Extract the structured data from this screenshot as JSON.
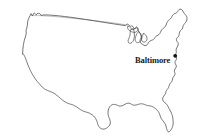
{
  "figure": {
    "type": "map",
    "region": "United States (contiguous 48 states)",
    "background_color": "#ffffff",
    "outline_color": "#3a3a3a",
    "width": 210,
    "height": 140
  },
  "markers": [
    {
      "name": "Baltimore",
      "label": "Baltimore",
      "dot_color": "#111111",
      "dot_x": 175.2,
      "dot_y": 55.8,
      "label_x": 135,
      "label_y": 55.5
    }
  ],
  "map_outline": {
    "mainland": "M22.6,53.9 L22.9,49.0 L23.4,44.6 L24.3,40.5 L25.4,36.8 L26.3,33.1 L26.0,30.6 L26.8,28.0 L27.4,25.1 L27.6,22.3 L28.2,19.6 L29.3,17.2 L30.3,15.2 L31.0,13.6 L31.6,14.7 L32.1,16.0 L32.9,15.1 L33.5,13.8 L34.2,12.9 L35.3,13.7 L36.2,14.9 L37.0,13.9 L38.1,13.2 L39.4,13.5 L40.4,14.2 L41.1,15.4 L42.6,15.1 L45.0,14.9 L48.5,15.0 L53.0,15.3 L58.5,15.8 L64.5,16.5 L71.0,17.3 L78.0,18.3 L85.5,19.4 L93.0,20.6 L100.5,21.8 L108.0,23.0 L114.5,24.0 L119.8,24.8 L123.0,25.3 L125.2,25.6 L126.4,24.9 L127.2,23.9 L128.3,24.6 L129.4,25.6 L130.6,26.3 L131.8,25.8 L132.9,26.6 L133.8,27.8 L134.6,29.0 L135.6,28.6 L136.4,27.7 L137.4,28.3 L138.0,29.6 L138.5,31.0 L139.3,32.2 L140.0,33.5 L140.7,34.9 L141.2,36.4 L141.0,38.0 L140.4,39.3 L140.0,40.7 L140.3,42.1 L141.0,43.2 L141.9,44.0 L142.9,44.6 L143.9,45.2 L145.0,45.6 L146.2,45.5 L147.1,44.8 L147.8,43.8 L148.4,42.6 L149.2,41.6 L150.2,40.9 L151.3,40.4 L152.4,40.0 L153.5,39.4 L154.4,38.5 L155.1,37.4 L155.9,36.4 L156.9,35.7 L158.0,35.2 L159.0,34.5 L159.8,33.5 L160.4,32.3 L161.0,31.0 L161.7,29.8 L162.6,28.8 L163.6,28.1 L164.6,27.3 L165.4,26.3 L166.0,25.1 L166.5,23.8 L167.0,22.5 L167.7,21.3 L168.6,20.3 L169.6,19.5 L170.6,18.6 L171.4,17.6 L172.0,16.4 L172.7,15.2 L173.6,14.3 L174.7,13.7 L175.8,13.2 L176.8,12.5 L177.6,11.6 L178.2,10.5 L179.0,9.6 L180.1,9.1 L181.2,9.3 L182.1,10.0 L182.8,11.0 L183.4,12.1 L184.1,13.2 L184.9,14.2 L185.8,15.1 L186.5,16.2 L186.9,17.5 L187.0,18.8 L186.8,20.1 L186.3,21.3 L185.6,22.4 L184.8,23.4 L184.0,24.4 L183.3,25.5 L182.9,26.8 L182.6,28.1 L182.0,29.2 L181.2,30.1 L180.3,30.9 L179.6,31.9 L179.3,33.1 L179.2,34.4 L178.9,35.6 L178.3,36.6 L177.5,37.4 L176.8,38.3 L176.4,39.5 L176.6,40.7 L177.2,41.7 L177.9,42.6 L178.3,43.7 L178.2,44.9 L177.8,46.0 L177.2,47.0 L176.6,48.0 L176.2,49.2 L176.1,50.4 L176.3,51.6 L176.2,52.8 L175.8,53.9 L175.2,54.9 L175.6,56.0 L176.2,57.0 L176.5,58.2 L176.3,59.4 L175.8,60.4 L175.2,61.4 L175.0,62.6 L175.3,63.8 L175.9,64.8 L176.3,65.9 L176.2,67.1 L175.7,68.1 L175.0,69.0 L174.5,70.1 L174.4,71.3 L174.7,72.5 L175.0,73.7 L174.8,74.9 L174.2,75.9 L173.5,76.8 L172.9,77.8 L172.5,79.0 L172.3,80.2 L171.9,81.3 L171.2,82.3 L170.4,83.2 L169.7,84.2 L169.2,85.3 L168.9,86.5 L168.5,87.6 L167.9,88.6 L167.2,89.5 L166.5,90.5 L166.0,91.6 L165.7,92.8 L165.3,93.9 L164.7,94.9 L164.0,95.8 L163.3,96.8 L162.8,97.9 L162.6,99.1 L162.8,100.3 L163.4,101.3 L164.2,102.1 L165.1,102.8 L166.0,103.6 L166.8,104.5 L167.5,105.5 L168.1,106.6 L168.6,107.7 L169.2,108.8 L169.8,109.9 L170.4,111.0 L171.0,112.1 L171.5,113.3 L171.9,114.5 L172.3,115.7 L172.6,116.9 L172.8,118.1 L173.0,119.3 L173.1,120.5 L173.2,121.7 L173.2,122.9 L173.1,124.1 L172.9,125.3 L172.6,126.5 L172.2,127.6 L171.7,128.7 L171.1,129.7 L170.4,130.6 L169.6,131.4 L168.8,132.0 L167.9,131.6 L167.3,130.7 L166.9,129.6 L166.6,128.4 L166.3,127.2 L166.0,126.0 L165.6,124.9 L165.1,123.8 L164.5,122.8 L163.8,121.9 L163.1,121.0 L162.4,120.1 L161.7,119.2 L161.1,118.2 L160.6,117.1 L160.2,116.0 L159.8,114.8 L159.4,113.7 L158.9,112.6 L158.3,111.6 L157.6,110.7 L156.9,109.9 L156.1,109.1 L155.3,108.4 L154.4,107.8 L153.5,107.2 L152.6,106.7 L151.6,106.3 L150.6,106.0 L149.6,105.8 L148.5,105.7 L147.5,105.5 L146.5,105.2 L145.5,104.8 L144.5,104.4 L143.5,104.1 L142.5,103.9 L141.5,103.8 L140.5,103.8 L139.5,104.0 L138.5,104.3 L137.5,104.6 L136.5,104.9 L135.5,105.1 L134.5,105.2 L133.5,105.1 L132.5,104.8 L131.6,104.3 L130.7,103.8 L129.8,103.4 L128.8,103.2 L127.8,103.2 L126.8,103.4 L125.9,103.8 L125.0,104.3 L124.1,104.8 L123.2,105.3 L122.2,105.7 L121.2,106.0 L120.2,106.1 L119.2,106.0 L118.3,105.7 L117.4,105.3 L116.5,104.9 L115.5,104.6 L114.5,104.4 L113.5,104.4 L112.5,104.6 L111.6,105.0 L110.8,105.6 L110.1,106.3 L109.5,107.1 L109.0,108.0 L108.6,109.0 L108.3,110.0 L108.1,111.0 L108.0,112.1 L108.0,113.2 L108.1,114.3 L108.3,115.4 L108.6,116.5 L109.0,117.5 L109.4,118.6 L109.8,119.6 L110.1,120.7 L110.3,121.8 L110.3,122.9 L110.1,124.0 L109.7,125.0 L109.1,125.9 L108.4,126.7 L107.6,127.4 L106.7,128.0 L105.8,128.5 L104.8,128.9 L103.8,129.1 L102.8,129.1 L101.8,128.9 L100.9,128.5 L100.1,127.9 L99.4,127.2 L98.8,126.4 L98.3,125.5 L97.9,124.5 L97.6,123.5 L97.3,122.4 L97.0,121.4 L96.6,120.4 L96.1,119.4 L95.6,118.5 L95.0,117.6 L94.3,116.8 L93.6,116.0 L92.8,115.3 L92.0,114.7 L91.1,114.1 L90.2,113.6 L89.3,113.1 L88.3,112.7 L87.3,112.4 L86.3,112.1 L85.3,111.8 L84.3,111.5 L83.3,111.1 L82.4,110.7 L81.5,110.2 L80.6,109.7 L79.7,109.1 L78.9,108.5 L78.0,107.9 L77.2,107.3 L76.3,106.7 L75.4,106.2 L74.5,105.7 L73.6,105.2 L72.6,104.8 L71.6,104.5 L70.6,104.2 L69.6,103.9 L68.6,103.6 L67.6,103.2 L66.7,102.8 L65.8,102.3 L64.9,101.8 L64.0,101.2 L63.2,100.6 L62.3,100.0 L61.5,99.3 L60.7,98.6 L59.9,97.9 L59.1,97.2 L58.3,96.5 L57.5,95.8 L56.6,95.2 L55.8,94.5 L54.9,93.9 L54.0,93.3 L53.1,92.8 L52.2,92.3 L51.2,91.9 L50.3,91.5 L49.3,91.1 L48.3,90.8 L47.4,90.4 L46.4,90.0 L45.5,89.5 L44.6,89.0 L43.8,88.4 L43.0,87.7 L42.2,87.0 L41.5,86.3 L40.8,85.5 L40.1,84.7 L39.4,83.9 L38.7,83.1 L38.0,82.3 L37.3,81.5 L36.6,80.6 L36.0,79.8 L35.3,78.9 L34.7,78.0 L34.1,77.1 L33.5,76.2 L32.9,75.2 L32.4,74.3 L31.8,73.3 L31.3,72.3 L30.8,71.3 L30.3,70.3 L29.8,69.3 L29.3,68.2 L28.9,67.2 L28.4,66.1 L28.0,65.1 L27.6,64.0 L27.2,62.9 L26.8,61.8 L26.4,60.7 L26.0,59.6 L25.6,58.5 L25.2,57.4 L24.7,56.4 L24.2,55.4 L23.6,54.5 L23.0,53.9 Z",
    "northern_border_faint": "M32.5,15.6 L40.0,15.6 L50.0,16.2 L62.0,17.2 L74.0,18.4 L88.0,19.9 L102.0,21.5 L114.0,23.0 L122.0,24.2 L126.0,24.9",
    "great_lakes": [
      "M128.0,26.0 L129.4,26.7 L130.3,27.6 L131.0,28.6 L131.9,29.2 L133.0,29.3 L134.0,29.0 L134.8,28.4 L135.5,27.6 L136.3,27.1 L137.2,27.2 L137.8,27.9 L138.1,28.9 L138.0,29.9 L137.5,30.8 L136.8,31.5 L136.0,32.0 L135.1,32.3 L134.2,32.4 L133.3,32.3 L132.4,32.0 L131.5,31.7 L130.6,31.3 L129.8,30.8 L129.0,30.2 L128.3,29.5 L127.8,28.7 L127.6,27.8 L127.7,26.9 Z",
      "M138.8,31.8 L139.8,32.6 L140.6,33.6 L141.2,34.7 L141.6,35.9 L141.8,37.1 L141.7,38.3 L141.4,39.5 L140.9,40.6 L140.2,41.5 L139.3,42.2 L138.3,42.6 L137.3,42.6 L136.4,42.2 L135.7,41.5 L135.3,40.6 L135.2,39.6 L135.3,38.5 L135.5,37.4 L135.8,36.3 L136.2,35.2 L136.7,34.2 L137.3,33.3 L138.0,32.5 Z",
      "M143.5,33.5 L144.6,34.0 L145.5,34.8 L146.2,35.7 L146.7,36.8 L147.0,37.9 L147.0,39.1 L146.7,40.2 L146.1,41.1 L145.3,41.8 L144.3,42.1 L143.3,42.0 L142.5,41.5 L141.9,40.7 L141.6,39.7 L141.6,38.6 L141.8,37.5 L142.2,36.4 L142.7,35.4 L143.1,34.4 Z"
    ],
    "michigan_peninsula": "M133.5,29.2 L134.0,31.0 L134.3,33.0 L134.4,35.0 L134.3,37.0 L134.0,38.8 L133.5,40.3 L132.8,41.5 L132.0,42.4 L131.1,43.0 L130.2,43.3 L129.3,43.2 L128.6,42.7 L128.2,41.9 L128.1,40.9 L128.3,39.8 L128.7,38.7 L129.2,37.6 L129.6,36.4 L129.9,35.2 L130.1,33.9 L130.2,32.6 L130.3,31.3 L130.5,30.1 Z"
  },
  "chart_data": {
    "type": "map",
    "title": "",
    "projection_extent": {
      "left_x": 22,
      "right_x": 188,
      "top_y": 9,
      "bottom_y": 133
    },
    "points": [
      {
        "label": "Baltimore",
        "x": 175.2,
        "y": 55.8
      }
    ],
    "legend": [],
    "annotations": [
      "Baltimore"
    ]
  }
}
